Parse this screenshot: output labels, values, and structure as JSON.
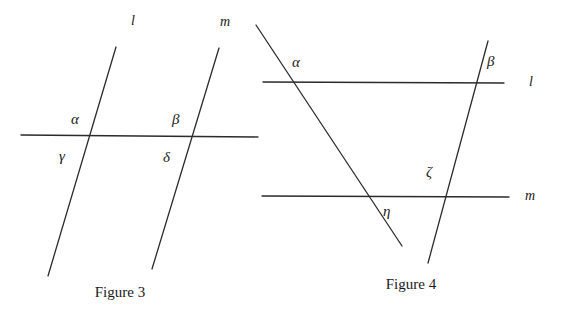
{
  "page": {
    "width": 566,
    "height": 309,
    "background_color": "#ffffff",
    "stroke_color": "#2b2b2b",
    "text_color": "#1a1a1a"
  },
  "figures": [
    {
      "id": "figure-3",
      "caption": "Figure 3",
      "caption_x": 120,
      "caption_y": 285,
      "description": "Two parallel lines l and m cut by a horizontal transversal, forming angles alpha, beta, gamma, delta",
      "lines": [
        {
          "name": "line-l",
          "label": "l",
          "label_x": 131,
          "label_y": 14,
          "x1": 116,
          "y1": 47,
          "x2": 48,
          "y2": 276
        },
        {
          "name": "line-m",
          "label": "m",
          "label_x": 220,
          "label_y": 15,
          "x1": 219,
          "y1": 48,
          "x2": 152,
          "y2": 269
        },
        {
          "name": "transversal",
          "label": "",
          "label_x": 0,
          "label_y": 0,
          "x1": 21,
          "y1": 135,
          "x2": 258,
          "y2": 137
        }
      ],
      "angle_labels": [
        {
          "name": "angle-alpha",
          "text": "α",
          "x": 71,
          "y": 112
        },
        {
          "name": "angle-beta",
          "text": "β",
          "x": 172,
          "y": 112
        },
        {
          "name": "angle-gamma",
          "text": "γ",
          "x": 59,
          "y": 149
        },
        {
          "name": "angle-delta",
          "text": "δ",
          "x": 163,
          "y": 150
        }
      ]
    },
    {
      "id": "figure-4",
      "caption": "Figure 4",
      "caption_x": 411,
      "caption_y": 277,
      "description": "Two horizontal parallel lines l and m cut by two transversals, forming angles alpha, beta, zeta, eta",
      "lines": [
        {
          "name": "line-l",
          "label": "l",
          "label_x": 529,
          "label_y": 75,
          "x1": 263,
          "y1": 82,
          "x2": 504,
          "y2": 83
        },
        {
          "name": "line-m",
          "label": "m",
          "label_x": 525,
          "label_y": 189,
          "x1": 262,
          "y1": 196,
          "x2": 509,
          "y2": 197
        },
        {
          "name": "transversal-left",
          "label": "",
          "label_x": 0,
          "label_y": 0,
          "x1": 256,
          "y1": 25,
          "x2": 402,
          "y2": 246
        },
        {
          "name": "transversal-right",
          "label": "",
          "label_x": 0,
          "label_y": 0,
          "x1": 488,
          "y1": 41,
          "x2": 428,
          "y2": 263
        }
      ],
      "angle_labels": [
        {
          "name": "angle-alpha",
          "text": "α",
          "x": 292,
          "y": 55
        },
        {
          "name": "angle-beta",
          "text": "β",
          "x": 487,
          "y": 54
        },
        {
          "name": "angle-zeta",
          "text": "ζ",
          "x": 426,
          "y": 165
        },
        {
          "name": "angle-eta",
          "text": "η",
          "x": 383,
          "y": 204
        }
      ]
    }
  ]
}
